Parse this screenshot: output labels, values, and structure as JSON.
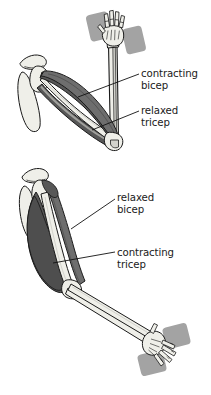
{
  "figure": {
    "background_color": "#ffffff",
    "palette": {
      "outline": "#1a1a1a",
      "bone_light": "#efefe9",
      "bone_shade": "#d2d2cc",
      "muscle_dark": "#575757",
      "muscle_mid": "#6e6e6e",
      "muscle_light": "#dcdcd6",
      "tendon": "#e8e8e2",
      "weight_plate": "#a3a3a3",
      "weight_plate_shade": "#8f8f8f",
      "leader_line": "#111111",
      "text": "#1a1a1a"
    },
    "panels": [
      {
        "id": "flexed-arm",
        "name": "flexed arm holding dumbbell",
        "description": "Upper diagram: arm bent at the elbow, forearm vertical, hand gripping a dumbbell overhead",
        "labels": [
          {
            "id": "contracting-bicep",
            "line1": "contracting",
            "line2": "bicep",
            "points_at": "bicep muscle belly"
          },
          {
            "id": "relaxed-tricep",
            "line1": "relaxed",
            "line2": "tricep",
            "points_at": "tricep muscle along the back of the upper arm"
          }
        ]
      },
      {
        "id": "extended-arm",
        "name": "extended arm holding dumbbell",
        "description": "Lower diagram: arm extended downward and out, hand gripping a dumbbell at the bottom",
        "labels": [
          {
            "id": "relaxed-bicep",
            "line1": "relaxed",
            "line2": "bicep",
            "points_at": "bicep muscle belly"
          },
          {
            "id": "contracting-tricep",
            "line1": "contracting",
            "line2": "tricep",
            "points_at": "tricep muscle along the back of the upper arm"
          }
        ]
      }
    ]
  },
  "labels": {
    "contracting_bicep": {
      "line1": "contracting",
      "line2": "bicep"
    },
    "relaxed_tricep": {
      "line1": "relaxed",
      "line2": "tricep"
    },
    "relaxed_bicep": {
      "line1": "relaxed",
      "line2": "bicep"
    },
    "contracting_tricep": {
      "line1": "contracting",
      "line2": "tricep"
    }
  }
}
